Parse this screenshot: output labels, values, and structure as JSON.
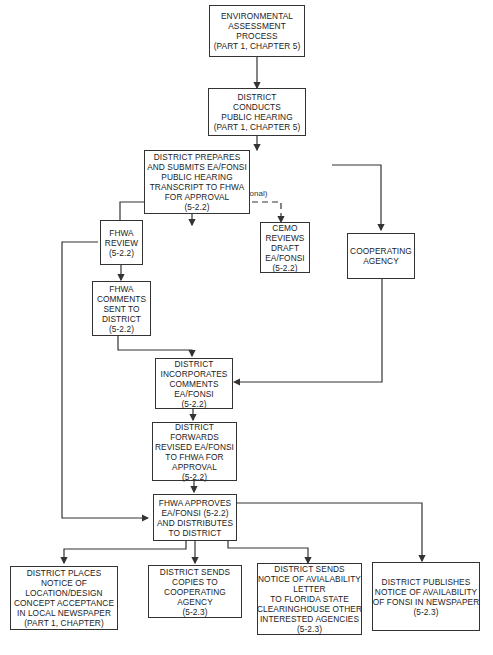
{
  "diagram": {
    "boxes": {
      "ea_process": [
        "ENVIRONMENTAL",
        "ASSESSMENT",
        "PROCESS",
        "(PART 1, CHAPTER 5)"
      ],
      "public_hearing": [
        "DISTRICT",
        "CONDUCTS",
        "PUBLIC HEARING",
        "(PART 1, CHAPTER 5)"
      ],
      "prepares_submits": [
        "DISTRICT PREPARES",
        "AND SUBMITS EA/FONSI",
        "PUBLIC HEARING",
        "TRANSCRIPT TO FHWA",
        "FOR APPROVAL",
        "(5-2.2)"
      ],
      "fhwa_review": [
        "FHWA",
        "REVIEW",
        "(5-2.2)"
      ],
      "cemo_reviews": [
        "CEMO",
        "REVIEWS",
        "DRAFT",
        "EA/FONSI",
        "(5-2.2)"
      ],
      "cooperating_agency": [
        "COOPERATING",
        "AGENCY"
      ],
      "fhwa_comments": [
        "FHWA",
        "COMMENTS",
        "SENT TO",
        "DISTRICT",
        "(5-2.2)"
      ],
      "incorporates": [
        "DISTRICT",
        "INCORPORATES",
        "COMMENTS",
        "EA/FONSI",
        "(5-2.2)"
      ],
      "forwards_revised": [
        "DISTRICT",
        "FORWARDS",
        "REVISED EA/FONSI",
        "TO FHWA FOR",
        "APPROVAL",
        "(5-2.2)"
      ],
      "fhwa_approves": [
        "FHWA APPROVES",
        "EA/FONSI (5-2.2)",
        "AND DISTRIBUTES",
        "TO DISTRICT"
      ],
      "places_notice": [
        "DISTRICT PLACES",
        "NOTICE OF",
        "LOCATION/DESIGN",
        "CONCEPT ACCEPTANCE",
        "IN LOCAL NEWSPAPER",
        "(PART 1, CHAPTER)"
      ],
      "sends_copies": [
        "DISTRICT SENDS",
        "COPIES TO",
        "COOPERATING",
        "AGENCY",
        "(5-2.3)"
      ],
      "sends_notice_letter": [
        "DISTRICT SENDS",
        "NOTICE OF AVIALABILITY",
        "LETTER",
        "TO FLORIDA STATE",
        "CLEARINGHOUSE OTHER",
        "INTERESTED AGENCIES",
        "(5-2.3)"
      ],
      "publishes_notice": [
        "DISTRICT PUBLISHES",
        "NOTICE OF AVAILABILITY",
        "OF FONSI IN NEWSPAPER",
        "(5-2.3)"
      ]
    },
    "labels": {
      "optional": "(optional)"
    },
    "colors": {
      "line": "#333333",
      "background": "#ffffff"
    }
  }
}
